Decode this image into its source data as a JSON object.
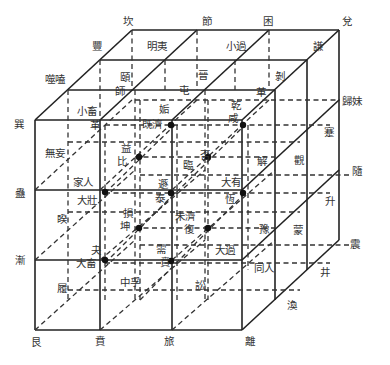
{
  "diagram": {
    "colors": {
      "line": "#222222",
      "text": "#333333",
      "background": "#ffffff"
    },
    "labels": [
      {
        "id": "kan",
        "text": "坎",
        "x": 128,
        "y": 21
      },
      {
        "id": "jie-tally",
        "text": "節",
        "x": 207,
        "y": 21
      },
      {
        "id": "kun-oppress",
        "text": "困",
        "x": 268,
        "y": 21
      },
      {
        "id": "dui",
        "text": "兌",
        "x": 347,
        "y": 21
      },
      {
        "id": "feng",
        "text": "豐",
        "x": 97,
        "y": 46
      },
      {
        "id": "mingyi",
        "text": "明夷",
        "x": 157,
        "y": 46
      },
      {
        "id": "xiaoguo",
        "text": "小過",
        "x": 236,
        "y": 46
      },
      {
        "id": "qian-modest",
        "text": "謙",
        "x": 318,
        "y": 46
      },
      {
        "id": "shihe",
        "text": "噬嗑",
        "x": 55,
        "y": 79
      },
      {
        "id": "yi-jaws",
        "text": "頤",
        "x": 125,
        "y": 77
      },
      {
        "id": "shi",
        "text": "師",
        "x": 120,
        "y": 91
      },
      {
        "id": "sheng-up2",
        "text": "晉",
        "x": 203,
        "y": 75
      },
      {
        "id": "bo",
        "text": "剝",
        "x": 280,
        "y": 76
      },
      {
        "id": "zhun",
        "text": "屯",
        "x": 184,
        "y": 90
      },
      {
        "id": "ge",
        "text": "革",
        "x": 261,
        "y": 92
      },
      {
        "id": "guimei",
        "text": "歸妹",
        "x": 352,
        "y": 101
      },
      {
        "id": "xiaoxu",
        "text": "小畜",
        "x": 87,
        "y": 111
      },
      {
        "id": "gou",
        "text": "姤",
        "x": 164,
        "y": 109
      },
      {
        "id": "qian-heaven",
        "text": "乾",
        "x": 236,
        "y": 105
      },
      {
        "id": "xun",
        "text": "巽",
        "x": 19,
        "y": 124
      },
      {
        "id": "ge2",
        "text": "革",
        "x": 95,
        "y": 125
      },
      {
        "id": "jiji",
        "text": "既濟",
        "x": 152,
        "y": 124
      },
      {
        "id": "xian",
        "text": "咸",
        "x": 233,
        "y": 118
      },
      {
        "id": "jian-obstruct",
        "text": "蹇",
        "x": 329,
        "y": 132
      },
      {
        "id": "wuwang",
        "text": "無妄",
        "x": 55,
        "y": 153
      },
      {
        "id": "yi-increase",
        "text": "益",
        "x": 126,
        "y": 148
      },
      {
        "id": "bi-hold",
        "text": "比",
        "x": 122,
        "y": 161
      },
      {
        "id": "pi",
        "text": "否",
        "x": 205,
        "y": 155
      },
      {
        "id": "lin",
        "text": "臨",
        "x": 188,
        "y": 165
      },
      {
        "id": "xie",
        "text": "解",
        "x": 262,
        "y": 161
      },
      {
        "id": "guan",
        "text": "觀",
        "x": 299,
        "y": 160
      },
      {
        "id": "sui",
        "text": "隨",
        "x": 357,
        "y": 171
      },
      {
        "id": "jiaren",
        "text": "家人",
        "x": 83,
        "y": 182
      },
      {
        "id": "dun",
        "text": "遯",
        "x": 163,
        "y": 184
      },
      {
        "id": "dayou",
        "text": "大有",
        "x": 231,
        "y": 182
      },
      {
        "id": "gu",
        "text": "蠱",
        "x": 20,
        "y": 193
      },
      {
        "id": "dazhuang",
        "text": "大壯",
        "x": 87,
        "y": 200
      },
      {
        "id": "tai",
        "text": "泰",
        "x": 160,
        "y": 198
      },
      {
        "id": "heng",
        "text": "恆",
        "x": 230,
        "y": 199
      },
      {
        "id": "sheng",
        "text": "升",
        "x": 330,
        "y": 201
      },
      {
        "id": "kui",
        "text": "睽",
        "x": 62,
        "y": 219
      },
      {
        "id": "sun",
        "text": "損",
        "x": 128,
        "y": 213
      },
      {
        "id": "weiji",
        "text": "未濟",
        "x": 185,
        "y": 216
      },
      {
        "id": "kun-earth",
        "text": "坤",
        "x": 125,
        "y": 226
      },
      {
        "id": "fu",
        "text": "復",
        "x": 189,
        "y": 229
      },
      {
        "id": "yu",
        "text": "豫",
        "x": 264,
        "y": 229
      },
      {
        "id": "meng",
        "text": "蒙",
        "x": 298,
        "y": 230
      },
      {
        "id": "zhen",
        "text": "震",
        "x": 355,
        "y": 244
      },
      {
        "id": "guai",
        "text": "夬",
        "x": 96,
        "y": 250
      },
      {
        "id": "xu",
        "text": "需",
        "x": 161,
        "y": 249
      },
      {
        "id": "daguo",
        "text": "大過",
        "x": 225,
        "y": 250
      },
      {
        "id": "jian-gradual",
        "text": "漸",
        "x": 20,
        "y": 260
      },
      {
        "id": "daxu",
        "text": "大畜",
        "x": 86,
        "y": 263
      },
      {
        "id": "bi-adorn",
        "text": "賁",
        "x": 165,
        "y": 262
      },
      {
        "id": "tongren",
        "text": "同人",
        "x": 264,
        "y": 268
      },
      {
        "id": "jing",
        "text": "井",
        "x": 325,
        "y": 272
      },
      {
        "id": "lu-tread",
        "text": "履",
        "x": 62,
        "y": 288
      },
      {
        "id": "zhongfu",
        "text": "中孚",
        "x": 130,
        "y": 282
      },
      {
        "id": "song",
        "text": "訟",
        "x": 200,
        "y": 285
      },
      {
        "id": "huan",
        "text": "渙",
        "x": 292,
        "y": 305
      },
      {
        "id": "gen",
        "text": "艮",
        "x": 36,
        "y": 342
      },
      {
        "id": "ben",
        "text": "賁",
        "x": 100,
        "y": 341
      },
      {
        "id": "lu-travel",
        "text": "旅",
        "x": 169,
        "y": 341
      },
      {
        "id": "li",
        "text": "離",
        "x": 250,
        "y": 341
      }
    ],
    "black_dots": [
      {
        "x": 171,
        "y": 125
      },
      {
        "x": 243,
        "y": 125
      },
      {
        "x": 139,
        "y": 157
      },
      {
        "x": 208,
        "y": 157
      },
      {
        "x": 105,
        "y": 192
      },
      {
        "x": 171,
        "y": 193
      },
      {
        "x": 243,
        "y": 193
      },
      {
        "x": 139,
        "y": 228
      },
      {
        "x": 208,
        "y": 228
      },
      {
        "x": 105,
        "y": 260
      },
      {
        "x": 171,
        "y": 261
      }
    ]
  }
}
